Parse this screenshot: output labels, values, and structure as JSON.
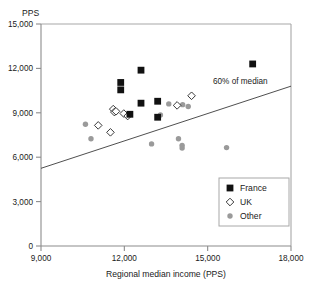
{
  "chart_data": {
    "type": "scatter",
    "title": "",
    "xlabel": "Regional median income (PPS)",
    "ylabel": "PPS",
    "ylabel_position": "top-left",
    "xlim": [
      9000,
      18000
    ],
    "ylim": [
      0,
      15000
    ],
    "xticks": [
      9000,
      12000,
      15000,
      18000
    ],
    "xtick_labels": [
      "9,000",
      "12,000",
      "15,000",
      "18,000"
    ],
    "yticks": [
      0,
      3000,
      6000,
      9000,
      12000,
      15000
    ],
    "ytick_labels": [
      "0",
      "3,000",
      "6,000",
      "9,000",
      "12,000",
      "15,000"
    ],
    "grid": false,
    "legend_position": "bottom-right",
    "annotations": [
      {
        "text": "60% of median",
        "x": 15550,
        "y": 10700
      }
    ],
    "reference_line": {
      "name": "60% of median",
      "x": [
        9000,
        18000
      ],
      "y": [
        5250,
        10800
      ],
      "color": "#3b3b3b"
    },
    "series": [
      {
        "name": "France",
        "marker": "filled-square",
        "color": "#111111",
        "points": [
          {
            "x": 11870,
            "y": 11050
          },
          {
            "x": 11870,
            "y": 10550
          },
          {
            "x": 12600,
            "y": 11880
          },
          {
            "x": 12600,
            "y": 9650
          },
          {
            "x": 13200,
            "y": 9780
          },
          {
            "x": 12200,
            "y": 8900
          },
          {
            "x": 13200,
            "y": 8700
          },
          {
            "x": 16620,
            "y": 12300
          }
        ]
      },
      {
        "name": "UK",
        "marker": "open-diamond",
        "color": "#ffffff",
        "points": [
          {
            "x": 11600,
            "y": 9250
          },
          {
            "x": 11640,
            "y": 9050
          },
          {
            "x": 11700,
            "y": 9100
          },
          {
            "x": 11980,
            "y": 8950
          },
          {
            "x": 12120,
            "y": 8780
          },
          {
            "x": 11060,
            "y": 8150
          },
          {
            "x": 11500,
            "y": 7680
          },
          {
            "x": 13900,
            "y": 9500
          },
          {
            "x": 14420,
            "y": 10150
          }
        ]
      },
      {
        "name": "Other",
        "marker": "filled-circle",
        "color": "#9a9a9a",
        "points": [
          {
            "x": 10600,
            "y": 8230
          },
          {
            "x": 10800,
            "y": 7250
          },
          {
            "x": 13300,
            "y": 8850
          },
          {
            "x": 13600,
            "y": 9600
          },
          {
            "x": 14100,
            "y": 9550
          },
          {
            "x": 14300,
            "y": 9430
          },
          {
            "x": 12980,
            "y": 6900
          },
          {
            "x": 13950,
            "y": 7250
          },
          {
            "x": 14080,
            "y": 6800
          },
          {
            "x": 14080,
            "y": 6620
          },
          {
            "x": 15680,
            "y": 6650
          }
        ]
      }
    ]
  },
  "legend": {
    "entries": [
      {
        "label": "France",
        "marker": "filled-square"
      },
      {
        "label": "UK",
        "marker": "open-diamond"
      },
      {
        "label": "Other",
        "marker": "filled-circle"
      }
    ]
  }
}
